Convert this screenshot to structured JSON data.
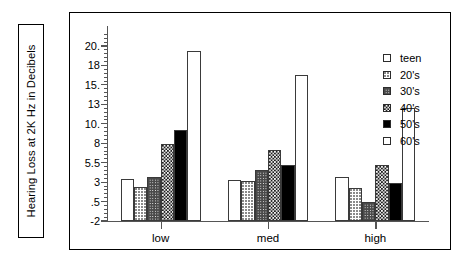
{
  "chart_data": {
    "type": "bar",
    "title": "",
    "subtitle": "",
    "xlabel": "",
    "ylabel": "Hearing Loss at 2K Hz in Decibels",
    "categories": [
      "low",
      "med",
      "high"
    ],
    "series": [
      {
        "name": "teen",
        "values": [
          3.4,
          3.3,
          3.6
        ],
        "swatch": "white"
      },
      {
        "name": "20's",
        "values": [
          2.4,
          3.2,
          2.3
        ],
        "swatch": "light-stipple"
      },
      {
        "name": "30's",
        "values": [
          3.6,
          4.5,
          0.5
        ],
        "swatch": "medium-gray-dots"
      },
      {
        "name": "40's",
        "values": [
          7.9,
          7.1,
          5.2
        ],
        "swatch": "dark-checker"
      },
      {
        "name": "50's",
        "values": [
          9.4,
          5.2,
          2.9
        ],
        "swatch": "solid-black"
      },
      {
        "name": "60's",
        "values": [
          19.5,
          16.5,
          12.4
        ],
        "swatch": "white"
      }
    ],
    "ytick_labels": [
      "20.",
      "18",
      "15.",
      "13",
      "10.",
      "8",
      "5.5",
      "3",
      ".5",
      "-2"
    ],
    "ytick_values": [
      20,
      18,
      15,
      13,
      10,
      8,
      5.5,
      3,
      0.5,
      -2
    ],
    "ylim": [
      -2,
      21.5
    ],
    "grid": false,
    "legend_position": "right",
    "legend_entries": [
      "teen",
      "20's",
      "30's",
      "40's",
      "50's",
      "60's"
    ],
    "axis_note": "ytick positions are evenly spaced (non-linear / compressed upper range)"
  },
  "figure": {
    "y_title_box_label": "Hearing Loss at 2K Hz in Decibels"
  }
}
